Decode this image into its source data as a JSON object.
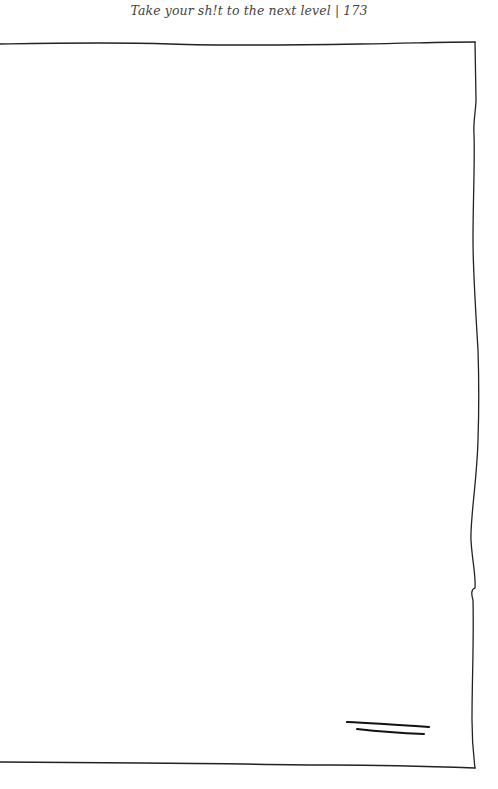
{
  "page": {
    "header_text": "Take your sh!t to the next level | 173",
    "running_title": "Take your sh!t to the next level",
    "page_number": "173"
  },
  "frame": {
    "style": "hand-drawn border, open on left side",
    "stroke_color": "#222222",
    "background": "#ffffff",
    "content": "blank writing space"
  },
  "decoration": {
    "name": "double-stroke-mark",
    "position": "bottom-right"
  }
}
